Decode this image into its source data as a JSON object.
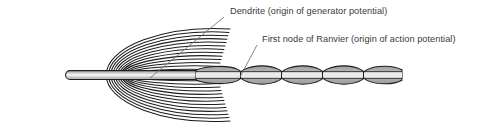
{
  "figure": {
    "background_color": "#ffffff",
    "line_color": "#1d1d1d",
    "myelin_fill_color": "#a6a6a6",
    "myelin_light_color": "#d6d6d6",
    "axon_core_color": "#ffffff",
    "text_color": "#3a3a3a",
    "leader_line_color": "#6e6e6e",
    "width": 499,
    "height": 130
  },
  "annotations": [
    {
      "id": "dendrite",
      "label": "Dendrite (origin of generator potential)",
      "text_x": 230,
      "text_y": 14,
      "leader_from_x": 224,
      "leader_from_y": 17,
      "leader_to_x": 150,
      "leader_to_y": 78
    },
    {
      "id": "first-node-of-ranvier",
      "label": "First node of Ranvier (origin of action potential)",
      "text_x": 262,
      "text_y": 42,
      "leader_from_x": 257,
      "leader_from_y": 45,
      "leader_to_x": 240,
      "leader_to_y": 77
    }
  ],
  "structures": {
    "myelin_spiral": {
      "name": "myelin sheath spiral wrapping",
      "center_x": 122,
      "center_y": 75,
      "outer_radius_x": 100,
      "outer_radius_y": 47,
      "loop_count": 13,
      "loop_spacing": 3.4
    },
    "inner_axon": {
      "name": "axon core inside spiral",
      "left_x": 62,
      "right_x": 230,
      "center_y": 75,
      "half_height": 4.5
    },
    "myelin_segments": {
      "name": "internodal myelin segments",
      "count": 5,
      "segments": [
        {
          "index": 1,
          "start_x": 198,
          "end_x": 240,
          "half_height": 9
        },
        {
          "index": 2,
          "start_x": 241,
          "end_x": 281,
          "half_height": 9
        },
        {
          "index": 3,
          "start_x": 282,
          "end_x": 322,
          "half_height": 9
        },
        {
          "index": 4,
          "start_x": 323,
          "end_x": 363,
          "half_height": 9
        },
        {
          "index": 5,
          "start_x": 364,
          "end_x": 403,
          "half_height": 9
        }
      ]
    },
    "nodes_of_ranvier": {
      "name": "nodes of Ranvier gaps",
      "positions_x": [
        240,
        281,
        322,
        363
      ]
    },
    "axon_terminus_x": 404
  }
}
